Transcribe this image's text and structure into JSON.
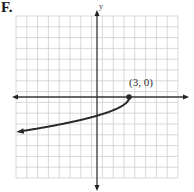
{
  "figure_label": "F.",
  "chart_data": {
    "type": "line",
    "title": "",
    "xlabel": "",
    "ylabel": "y",
    "xlim": [
      -7.5,
      7.5
    ],
    "ylim": [
      -7.5,
      7.5
    ],
    "grid": true,
    "function": "y = -sqrt(3 - x)",
    "endpoint": {
      "x": 3,
      "y": 0,
      "label": "(3, 0)",
      "closed": true
    },
    "series": [
      {
        "name": "curve",
        "x": [
          -7,
          -5,
          -3,
          -1,
          0,
          1,
          2,
          2.75,
          3
        ],
        "y": [
          -3.16,
          -2.83,
          -2.45,
          -2.0,
          -1.73,
          -1.41,
          -1.0,
          -0.5,
          0
        ]
      }
    ],
    "arrow_direction": "left"
  },
  "annotations": {
    "point_label": "(3, 0)",
    "y_axis_label": "y"
  }
}
